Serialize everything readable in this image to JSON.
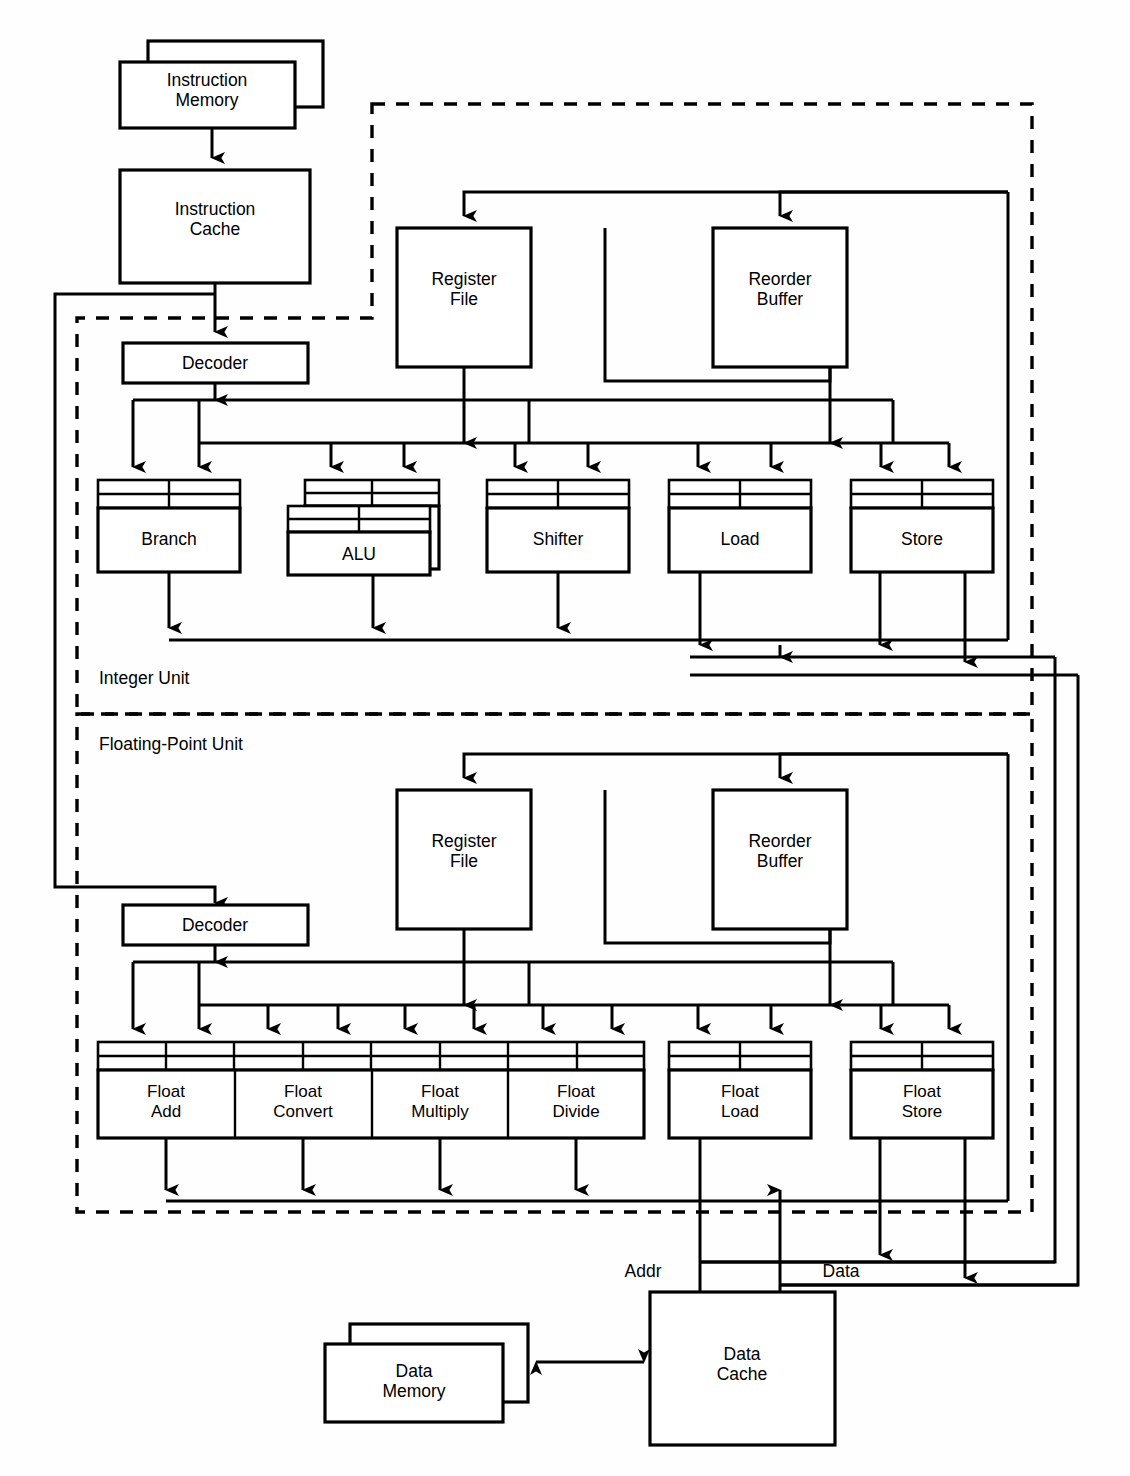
{
  "diagram": {
    "type": "block-diagram",
    "regions": [
      {
        "id": "integer-unit",
        "label": "Integer Unit"
      },
      {
        "id": "floating-point-unit",
        "label": "Floating-Point Unit"
      }
    ],
    "memory": {
      "instruction_memory": "Instruction\nMemory",
      "instruction_memory_line1": "Instruction",
      "instruction_memory_line2": "Memory",
      "instruction_cache_line1": "Instruction",
      "instruction_cache_line2": "Cache",
      "data_memory_line1": "Data",
      "data_memory_line2": "Memory",
      "data_cache_line1": "Data",
      "data_cache_line2": "Cache"
    },
    "integer": {
      "decoder": "Decoder",
      "register_file_line1": "Register",
      "register_file_line2": "File",
      "reorder_buffer_line1": "Reorder",
      "reorder_buffer_line2": "Buffer",
      "units": [
        {
          "name": "Branch",
          "line1": "Branch",
          "line2": "",
          "stacked": false
        },
        {
          "name": "ALU",
          "line1": "ALU",
          "line2": "",
          "stacked": true
        },
        {
          "name": "Shifter",
          "line1": "Shifter",
          "line2": "",
          "stacked": false
        },
        {
          "name": "Load",
          "line1": "Load",
          "line2": "",
          "stacked": false
        },
        {
          "name": "Store",
          "line1": "Store",
          "line2": "",
          "stacked": false
        }
      ]
    },
    "floating_point": {
      "decoder": "Decoder",
      "register_file_line1": "Register",
      "register_file_line2": "File",
      "reorder_buffer_line1": "Reorder",
      "reorder_buffer_line2": "Buffer",
      "units": [
        {
          "name": "Float Add",
          "line1": "Float",
          "line2": "Add"
        },
        {
          "name": "Float Convert",
          "line1": "Float",
          "line2": "Convert"
        },
        {
          "name": "Float Multiply",
          "line1": "Float",
          "line2": "Multiply"
        },
        {
          "name": "Float Divide",
          "line1": "Float",
          "line2": "Divide"
        },
        {
          "name": "Float Load",
          "line1": "Float",
          "line2": "Load"
        },
        {
          "name": "Float Store",
          "line1": "Float",
          "line2": "Store"
        }
      ]
    },
    "bus_labels": {
      "addr": "Addr",
      "data": "Data"
    },
    "colors": {
      "line": "#000000",
      "fill": "#ffffff",
      "background": "#ffffff"
    }
  }
}
